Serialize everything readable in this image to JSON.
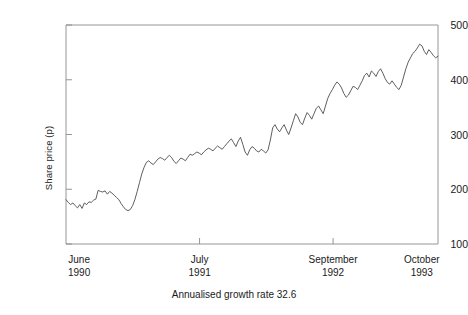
{
  "chart_data": {
    "type": "line",
    "title": "",
    "subtitle": "",
    "caption": "Annualised growth rate 32.6",
    "xlabel": "",
    "ylabel": "Share price (p)",
    "ylim": [
      100,
      500
    ],
    "yticks": [
      100,
      200,
      300,
      400,
      500
    ],
    "ytick_labels": [
      "100",
      "200",
      "300",
      "400",
      "500"
    ],
    "grid": false,
    "legend": "none",
    "x_axis_type": "date",
    "xlim": [
      0,
      100
    ],
    "xticks": [
      0,
      35.9,
      71.8,
      100
    ],
    "xtick_labels": [
      {
        "month": "June",
        "year": "1990"
      },
      {
        "month": "July",
        "year": "1991"
      },
      {
        "month": "September",
        "year": "1992"
      },
      {
        "month": "October",
        "year": "1993"
      }
    ],
    "line_color": "#4d4d4d",
    "axis_color": "#8a8a8a",
    "background": "#ffffff",
    "series": [
      {
        "name": "Share price",
        "values": [
          181,
          176,
          172,
          175,
          170,
          166,
          172,
          165,
          175,
          172,
          177,
          176,
          180,
          182,
          198,
          196,
          195,
          197,
          191,
          196,
          193,
          189,
          185,
          181,
          174,
          168,
          163,
          161,
          163,
          170,
          181,
          196,
          212,
          228,
          240,
          249,
          252,
          248,
          245,
          250,
          255,
          258,
          256,
          253,
          258,
          262,
          258,
          251,
          247,
          252,
          257,
          255,
          252,
          258,
          264,
          262,
          265,
          268,
          266,
          263,
          268,
          272,
          275,
          273,
          270,
          275,
          279,
          276,
          273,
          278,
          283,
          288,
          292,
          285,
          278,
          288,
          295,
          282,
          268,
          262,
          272,
          278,
          275,
          270,
          268,
          273,
          270,
          266,
          272,
          290,
          312,
          318,
          310,
          305,
          312,
          318,
          308,
          300,
          312,
          325,
          338,
          332,
          322,
          318,
          330,
          340,
          335,
          328,
          338,
          348,
          352,
          345,
          338,
          352,
          366,
          375,
          382,
          390,
          396,
          392,
          385,
          375,
          368,
          372,
          380,
          388,
          386,
          382,
          390,
          398,
          408,
          412,
          405,
          416,
          412,
          406,
          415,
          420,
          412,
          402,
          395,
          392,
          398,
          392,
          386,
          382,
          390,
          405,
          420,
          432,
          440,
          448,
          452,
          458,
          465,
          462,
          452,
          446,
          455,
          450,
          444,
          440,
          443
        ]
      }
    ]
  }
}
